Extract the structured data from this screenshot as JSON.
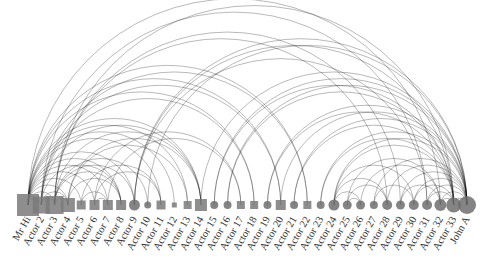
{
  "title": "",
  "nodes": [
    {
      "label": "Mr Hi",
      "shape": "square",
      "size": 22
    },
    {
      "label": "Actor 2",
      "shape": "square",
      "size": 17
    },
    {
      "label": "Actor 3",
      "shape": "square",
      "size": 18
    },
    {
      "label": "Actor 4",
      "shape": "square",
      "size": 14
    },
    {
      "label": "Actor 5",
      "shape": "square",
      "size": 9
    },
    {
      "label": "Actor 6",
      "shape": "square",
      "size": 10
    },
    {
      "label": "Actor 7",
      "shape": "square",
      "size": 10
    },
    {
      "label": "Actor 8",
      "shape": "square",
      "size": 10
    },
    {
      "label": "Actor 9",
      "shape": "circle",
      "size": 11
    },
    {
      "label": "Actor 10",
      "shape": "circle",
      "size": 7
    },
    {
      "label": "Actor 11",
      "shape": "square",
      "size": 9
    },
    {
      "label": "Actor 12",
      "shape": "square",
      "size": 5
    },
    {
      "label": "Actor 13",
      "shape": "square",
      "size": 8
    },
    {
      "label": "Actor 14",
      "shape": "square",
      "size": 12
    },
    {
      "label": "Actor 15",
      "shape": "circle",
      "size": 8
    },
    {
      "label": "Actor 16",
      "shape": "circle",
      "size": 8
    },
    {
      "label": "Actor 17",
      "shape": "square",
      "size": 8
    },
    {
      "label": "Actor 18",
      "shape": "square",
      "size": 8
    },
    {
      "label": "Actor 19",
      "shape": "circle",
      "size": 8
    },
    {
      "label": "Actor 20",
      "shape": "square",
      "size": 10
    },
    {
      "label": "Actor 21",
      "shape": "circle",
      "size": 8
    },
    {
      "label": "Actor 22",
      "shape": "square",
      "size": 8
    },
    {
      "label": "Actor 23",
      "shape": "circle",
      "size": 8
    },
    {
      "label": "Actor 24",
      "shape": "circle",
      "size": 11
    },
    {
      "label": "Actor 25",
      "shape": "circle",
      "size": 9
    },
    {
      "label": "Actor 26",
      "shape": "circle",
      "size": 9
    },
    {
      "label": "Actor 27",
      "shape": "circle",
      "size": 8
    },
    {
      "label": "Actor 28",
      "shape": "circle",
      "size": 10
    },
    {
      "label": "Actor 29",
      "shape": "circle",
      "size": 9
    },
    {
      "label": "Actor 30",
      "shape": "circle",
      "size": 10
    },
    {
      "label": "Actor 31",
      "shape": "circle",
      "size": 10
    },
    {
      "label": "Actor 32",
      "shape": "circle",
      "size": 12
    },
    {
      "label": "Actor 33",
      "shape": "circle",
      "size": 15
    },
    {
      "label": "John A",
      "shape": "circle",
      "size": 18
    }
  ],
  "edges": [
    [
      0,
      1
    ],
    [
      0,
      2
    ],
    [
      0,
      3
    ],
    [
      0,
      4
    ],
    [
      0,
      5
    ],
    [
      0,
      6
    ],
    [
      0,
      7
    ],
    [
      0,
      8
    ],
    [
      0,
      10
    ],
    [
      0,
      11
    ],
    [
      0,
      12
    ],
    [
      0,
      13
    ],
    [
      0,
      17
    ],
    [
      0,
      19
    ],
    [
      0,
      21
    ],
    [
      0,
      31
    ],
    [
      1,
      2
    ],
    [
      1,
      3
    ],
    [
      1,
      7
    ],
    [
      1,
      13
    ],
    [
      1,
      17
    ],
    [
      1,
      19
    ],
    [
      1,
      21
    ],
    [
      1,
      30
    ],
    [
      2,
      3
    ],
    [
      2,
      7
    ],
    [
      2,
      8
    ],
    [
      2,
      9
    ],
    [
      2,
      13
    ],
    [
      2,
      27
    ],
    [
      2,
      28
    ],
    [
      2,
      32
    ],
    [
      3,
      7
    ],
    [
      3,
      12
    ],
    [
      3,
      13
    ],
    [
      4,
      6
    ],
    [
      4,
      10
    ],
    [
      5,
      6
    ],
    [
      5,
      10
    ],
    [
      5,
      16
    ],
    [
      6,
      16
    ],
    [
      8,
      30
    ],
    [
      8,
      32
    ],
    [
      8,
      33
    ],
    [
      9,
      33
    ],
    [
      13,
      33
    ],
    [
      14,
      32
    ],
    [
      14,
      33
    ],
    [
      15,
      32
    ],
    [
      15,
      33
    ],
    [
      18,
      32
    ],
    [
      18,
      33
    ],
    [
      19,
      33
    ],
    [
      20,
      32
    ],
    [
      20,
      33
    ],
    [
      22,
      32
    ],
    [
      22,
      33
    ],
    [
      23,
      25
    ],
    [
      23,
      27
    ],
    [
      23,
      29
    ],
    [
      23,
      32
    ],
    [
      23,
      33
    ],
    [
      24,
      25
    ],
    [
      24,
      27
    ],
    [
      24,
      31
    ],
    [
      25,
      31
    ],
    [
      26,
      29
    ],
    [
      26,
      33
    ],
    [
      27,
      33
    ],
    [
      28,
      31
    ],
    [
      28,
      33
    ],
    [
      29,
      32
    ],
    [
      29,
      33
    ],
    [
      30,
      32
    ],
    [
      30,
      33
    ],
    [
      31,
      32
    ],
    [
      31,
      33
    ],
    [
      32,
      33
    ]
  ],
  "layout": {
    "x_start": 28,
    "x_end": 467,
    "baseline_y": 205,
    "label_angle": -60
  }
}
